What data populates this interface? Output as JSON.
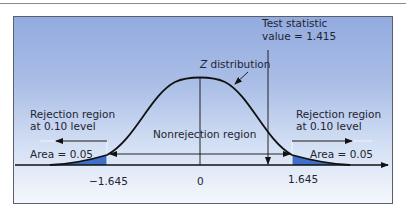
{
  "diagram": {
    "type": "two-tailed hypothesis test, standard normal",
    "curve_label_var": "Z",
    "curve_label_rest": " distribution",
    "test_statistic_line1": "Test statistic",
    "test_statistic_line2": "value = 1.415",
    "test_statistic_value": 1.415,
    "left_region": {
      "title_line1": "Rejection region",
      "title_line2": "at 0.10 level",
      "area_label": "Area = 0.05",
      "critical_value_label": "−1.645"
    },
    "right_region": {
      "title_line1": "Rejection region",
      "title_line2": "at 0.10 level",
      "area_label": "Area = 0.05",
      "critical_value_label": "1.645"
    },
    "center_region_label": "Nonrejection region",
    "center_value_label": "0",
    "colors": {
      "background_top": "#93abdf",
      "background_bottom": "#f5f8fd",
      "tail_fill": "#3f6fc9",
      "line": "#111111",
      "frame": "#5b5f6b"
    }
  }
}
